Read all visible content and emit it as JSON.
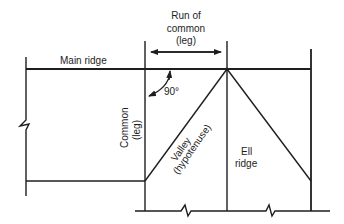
{
  "diagram": {
    "title_dimension": {
      "line1": "Run of",
      "line2": "common",
      "line3": "(leg)"
    },
    "labels": {
      "main_ridge": "Main ridge",
      "angle": "90°",
      "common_line1": "Common",
      "common_line2": "(leg)",
      "valley_line1": "Valley",
      "valley_line2": "(hypotenuse)",
      "ell_line1": "Ell",
      "ell_line2": "ridge"
    },
    "colors": {
      "line": "#1e1e1e",
      "background": "#ffffff"
    }
  }
}
